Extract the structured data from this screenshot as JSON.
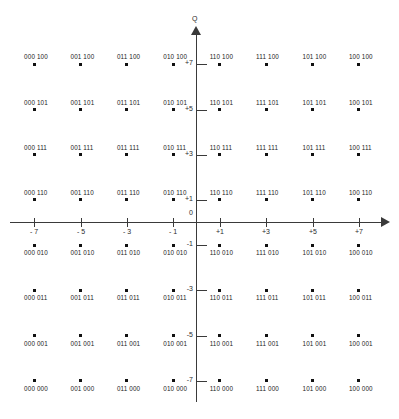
{
  "figure": {
    "type": "constellation-diagram",
    "modulation": "64-QAM",
    "axes": {
      "q_axis_label": "Q",
      "i_axis_label": "",
      "origin_label": "0",
      "i_ticks": [
        "- 7",
        "- 5",
        "- 3",
        "- 1",
        "+1",
        "+3",
        "+5",
        "+7"
      ],
      "q_ticks": [
        "+7",
        "+5",
        "+3",
        "+1",
        "-1",
        "-3",
        "-5",
        "-7"
      ]
    }
  },
  "chart_data": {
    "type": "scatter",
    "title": "",
    "xlabel": "",
    "ylabel": "Q",
    "xlim": [
      -8,
      8
    ],
    "ylim": [
      -8,
      8
    ],
    "grid": false,
    "legend": "none",
    "xticks": [
      -7,
      -5,
      -3,
      -1,
      1,
      3,
      5,
      7
    ],
    "yticks": [
      7,
      5,
      3,
      1,
      -1,
      -3,
      -5,
      -7
    ],
    "xticklabels": [
      "- 7",
      "- 5",
      "- 3",
      "- 1",
      "+1",
      "+3",
      "+5",
      "+7"
    ],
    "yticklabels": [
      "+7",
      "+5",
      "+3",
      "+1",
      "-1",
      "-3",
      "-5",
      "-7"
    ],
    "column_prefixes": [
      "000",
      "001",
      "011",
      "010",
      "110",
      "111",
      "101",
      "100"
    ],
    "row_suffixes": [
      "100",
      "101",
      "111",
      "110",
      "010",
      "011",
      "001",
      "000"
    ],
    "points": [
      {
        "x": -7,
        "y": 7,
        "label": "000 100"
      },
      {
        "x": -5,
        "y": 7,
        "label": "001 100"
      },
      {
        "x": -3,
        "y": 7,
        "label": "011 100"
      },
      {
        "x": -1,
        "y": 7,
        "label": "010 100"
      },
      {
        "x": 1,
        "y": 7,
        "label": "110 100"
      },
      {
        "x": 3,
        "y": 7,
        "label": "111 100"
      },
      {
        "x": 5,
        "y": 7,
        "label": "101 100"
      },
      {
        "x": 7,
        "y": 7,
        "label": "100 100"
      },
      {
        "x": -7,
        "y": 5,
        "label": "000 101"
      },
      {
        "x": -5,
        "y": 5,
        "label": "001 101"
      },
      {
        "x": -3,
        "y": 5,
        "label": "011 101"
      },
      {
        "x": -1,
        "y": 5,
        "label": "010 101"
      },
      {
        "x": 1,
        "y": 5,
        "label": "110 101"
      },
      {
        "x": 3,
        "y": 5,
        "label": "111 101"
      },
      {
        "x": 5,
        "y": 5,
        "label": "101 101"
      },
      {
        "x": 7,
        "y": 5,
        "label": "100 101"
      },
      {
        "x": -7,
        "y": 3,
        "label": "000 111"
      },
      {
        "x": -5,
        "y": 3,
        "label": "001 111"
      },
      {
        "x": -3,
        "y": 3,
        "label": "011 111"
      },
      {
        "x": -1,
        "y": 3,
        "label": "010 111"
      },
      {
        "x": 1,
        "y": 3,
        "label": "110 111"
      },
      {
        "x": 3,
        "y": 3,
        "label": "111 111"
      },
      {
        "x": 5,
        "y": 3,
        "label": "101 111"
      },
      {
        "x": 7,
        "y": 3,
        "label": "100 111"
      },
      {
        "x": -7,
        "y": 1,
        "label": "000 110"
      },
      {
        "x": -5,
        "y": 1,
        "label": "001 110"
      },
      {
        "x": -3,
        "y": 1,
        "label": "011 110"
      },
      {
        "x": -1,
        "y": 1,
        "label": "010 110"
      },
      {
        "x": 1,
        "y": 1,
        "label": "110 110"
      },
      {
        "x": 3,
        "y": 1,
        "label": "111 110"
      },
      {
        "x": 5,
        "y": 1,
        "label": "101 110"
      },
      {
        "x": 7,
        "y": 1,
        "label": "100 110"
      },
      {
        "x": -7,
        "y": -1,
        "label": "000 010"
      },
      {
        "x": -5,
        "y": -1,
        "label": "001 010"
      },
      {
        "x": -3,
        "y": -1,
        "label": "011 010"
      },
      {
        "x": -1,
        "y": -1,
        "label": "010 010"
      },
      {
        "x": 1,
        "y": -1,
        "label": "110 010"
      },
      {
        "x": 3,
        "y": -1,
        "label": "111 010"
      },
      {
        "x": 5,
        "y": -1,
        "label": "101 010"
      },
      {
        "x": 7,
        "y": -1,
        "label": "100 010"
      },
      {
        "x": -7,
        "y": -3,
        "label": "000 011"
      },
      {
        "x": -5,
        "y": -3,
        "label": "001 011"
      },
      {
        "x": -3,
        "y": -3,
        "label": "011 011"
      },
      {
        "x": -1,
        "y": -3,
        "label": "010 011"
      },
      {
        "x": 1,
        "y": -3,
        "label": "110 011"
      },
      {
        "x": 3,
        "y": -3,
        "label": "111 011"
      },
      {
        "x": 5,
        "y": -3,
        "label": "101 011"
      },
      {
        "x": 7,
        "y": -3,
        "label": "100 011"
      },
      {
        "x": -7,
        "y": -5,
        "label": "000 001"
      },
      {
        "x": -5,
        "y": -5,
        "label": "001 001"
      },
      {
        "x": -3,
        "y": -5,
        "label": "011 001"
      },
      {
        "x": -1,
        "y": -5,
        "label": "010 001"
      },
      {
        "x": 1,
        "y": -5,
        "label": "110 001"
      },
      {
        "x": 3,
        "y": -5,
        "label": "111 001"
      },
      {
        "x": 5,
        "y": -5,
        "label": "101 001"
      },
      {
        "x": 7,
        "y": -5,
        "label": "100 001"
      },
      {
        "x": -7,
        "y": -7,
        "label": "000 000"
      },
      {
        "x": -5,
        "y": -7,
        "label": "001 000"
      },
      {
        "x": -3,
        "y": -7,
        "label": "011 000"
      },
      {
        "x": -1,
        "y": -7,
        "label": "010 000"
      },
      {
        "x": 1,
        "y": -7,
        "label": "110 000"
      },
      {
        "x": 3,
        "y": -7,
        "label": "111 000"
      },
      {
        "x": 5,
        "y": -7,
        "label": "101 000"
      },
      {
        "x": 7,
        "y": -7,
        "label": "100 000"
      }
    ]
  },
  "colors": {
    "axis": "#3a3a3a",
    "point": "#111111",
    "text": "#232323",
    "background": "#ffffff"
  }
}
